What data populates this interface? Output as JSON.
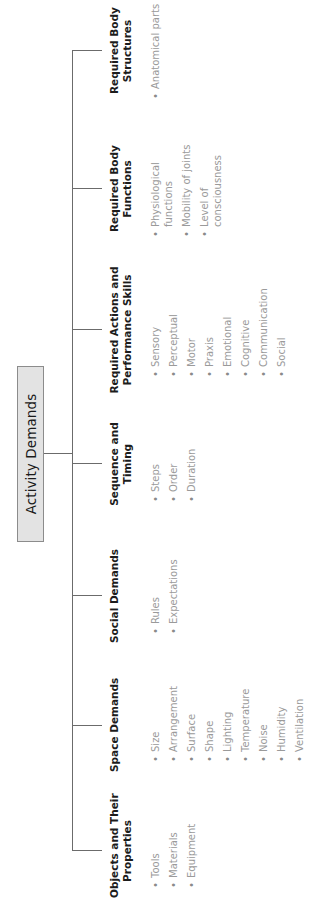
{
  "root": {
    "label": "Activity Demands"
  },
  "categories": [
    {
      "heading_lines": [
        "Objects and Their",
        "Properties"
      ],
      "items": [
        "Tools",
        "Materials",
        "Equipment"
      ]
    },
    {
      "heading_lines": [
        "Space Demands"
      ],
      "items": [
        "Size",
        "Arrangement",
        "Surface",
        "Shape",
        "Lighting",
        "Temperature",
        "Noise",
        "Humidity",
        "Ventilation"
      ]
    },
    {
      "heading_lines": [
        "Social Demands"
      ],
      "items": [
        "Rules",
        "Expectations"
      ]
    },
    {
      "heading_lines": [
        "Sequence and",
        "Timing"
      ],
      "items": [
        "Steps",
        "Order",
        "Duration"
      ]
    },
    {
      "heading_lines": [
        "Required Actions and",
        "Performance Skills"
      ],
      "items": [
        "Sensory",
        "Perceptual",
        "Motor",
        "Praxis",
        "Emotional",
        "Cognitive",
        "Communication",
        "Social"
      ]
    },
    {
      "heading_lines": [
        "Required Body",
        "Functions"
      ],
      "items": [
        [
          "Physiological",
          "functions"
        ],
        [
          "Mobility of joints"
        ],
        [
          "Level of",
          "consciousness"
        ]
      ]
    },
    {
      "heading_lines": [
        "Required Body",
        "Structures"
      ],
      "items": [
        "Anatomical parts"
      ]
    }
  ],
  "bullet_glyph": "•",
  "colors": {
    "root_fill": "#e3e3e3",
    "root_border": "#8c8c8c",
    "connector": "#6b6b6b",
    "heading_text": "#1c1c1c",
    "item_text": "#9a9a9a"
  }
}
